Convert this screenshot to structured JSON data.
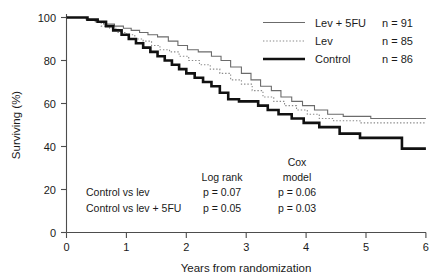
{
  "chart_data": {
    "type": "line",
    "title": "",
    "xlabel": "Years from randomization",
    "ylabel": "Surviving (%)",
    "xlim": [
      0,
      6
    ],
    "ylim": [
      0,
      100
    ],
    "xticks": [
      "0",
      "1",
      "2",
      "3",
      "4",
      "5",
      "6"
    ],
    "yticks": [
      "0",
      "20",
      "40",
      "60",
      "80",
      "100"
    ],
    "grid": false,
    "legend_position": "top-right",
    "series": [
      {
        "name": "Lev + 5FU",
        "n_label": "n = 91",
        "style": "thin-solid",
        "color": "#6b6b6b",
        "points": [
          [
            0.0,
            100
          ],
          [
            0.33,
            100
          ],
          [
            0.33,
            99
          ],
          [
            0.48,
            99
          ],
          [
            0.48,
            98
          ],
          [
            0.62,
            98
          ],
          [
            0.62,
            97
          ],
          [
            0.8,
            97
          ],
          [
            0.8,
            96
          ],
          [
            0.95,
            96
          ],
          [
            0.95,
            95
          ],
          [
            1.08,
            95
          ],
          [
            1.08,
            94
          ],
          [
            1.22,
            94
          ],
          [
            1.22,
            93
          ],
          [
            1.36,
            93
          ],
          [
            1.36,
            92
          ],
          [
            1.52,
            92
          ],
          [
            1.52,
            91
          ],
          [
            1.7,
            91
          ],
          [
            1.7,
            89
          ],
          [
            1.86,
            89
          ],
          [
            1.86,
            87
          ],
          [
            2.02,
            87
          ],
          [
            2.02,
            85
          ],
          [
            2.2,
            85
          ],
          [
            2.2,
            84
          ],
          [
            2.42,
            84
          ],
          [
            2.42,
            82
          ],
          [
            2.58,
            82
          ],
          [
            2.58,
            80
          ],
          [
            2.74,
            80
          ],
          [
            2.74,
            77
          ],
          [
            2.92,
            77
          ],
          [
            2.92,
            74
          ],
          [
            3.08,
            74
          ],
          [
            3.08,
            71
          ],
          [
            3.24,
            71
          ],
          [
            3.24,
            68
          ],
          [
            3.42,
            68
          ],
          [
            3.42,
            66
          ],
          [
            3.58,
            66
          ],
          [
            3.58,
            63
          ],
          [
            3.76,
            63
          ],
          [
            3.76,
            61
          ],
          [
            3.94,
            61
          ],
          [
            3.94,
            59
          ],
          [
            4.14,
            59
          ],
          [
            4.14,
            57
          ],
          [
            4.36,
            57
          ],
          [
            4.36,
            55
          ],
          [
            4.62,
            55
          ],
          [
            4.62,
            54
          ],
          [
            5.08,
            54
          ],
          [
            5.08,
            53
          ],
          [
            6.0,
            53
          ]
        ]
      },
      {
        "name": "Lev",
        "n_label": "n = 85",
        "style": "dotted",
        "color": "#8a8a8a",
        "points": [
          [
            0.0,
            100
          ],
          [
            0.33,
            100
          ],
          [
            0.33,
            99
          ],
          [
            0.46,
            99
          ],
          [
            0.46,
            98
          ],
          [
            0.58,
            98
          ],
          [
            0.58,
            96
          ],
          [
            0.72,
            96
          ],
          [
            0.72,
            95
          ],
          [
            0.86,
            95
          ],
          [
            0.86,
            93
          ],
          [
            1.0,
            93
          ],
          [
            1.0,
            92
          ],
          [
            1.14,
            92
          ],
          [
            1.14,
            90
          ],
          [
            1.28,
            90
          ],
          [
            1.28,
            89
          ],
          [
            1.42,
            89
          ],
          [
            1.42,
            87
          ],
          [
            1.56,
            87
          ],
          [
            1.56,
            85
          ],
          [
            1.72,
            85
          ],
          [
            1.72,
            84
          ],
          [
            1.88,
            84
          ],
          [
            1.88,
            82
          ],
          [
            2.04,
            82
          ],
          [
            2.04,
            80
          ],
          [
            2.22,
            80
          ],
          [
            2.22,
            78
          ],
          [
            2.4,
            78
          ],
          [
            2.4,
            76
          ],
          [
            2.56,
            76
          ],
          [
            2.56,
            74
          ],
          [
            2.74,
            74
          ],
          [
            2.74,
            71
          ],
          [
            2.92,
            71
          ],
          [
            2.92,
            69
          ],
          [
            3.1,
            69
          ],
          [
            3.1,
            66
          ],
          [
            3.28,
            66
          ],
          [
            3.28,
            63
          ],
          [
            3.46,
            63
          ],
          [
            3.46,
            61
          ],
          [
            3.64,
            61
          ],
          [
            3.64,
            59
          ],
          [
            3.84,
            59
          ],
          [
            3.84,
            57
          ],
          [
            4.02,
            57
          ],
          [
            4.02,
            55
          ],
          [
            4.22,
            55
          ],
          [
            4.22,
            53
          ],
          [
            4.46,
            53
          ],
          [
            4.46,
            52
          ],
          [
            4.9,
            52
          ],
          [
            4.9,
            51
          ],
          [
            6.0,
            51
          ]
        ]
      },
      {
        "name": "Control",
        "n_label": "n = 86",
        "style": "thick-solid",
        "color": "#111111",
        "points": [
          [
            0.0,
            100
          ],
          [
            0.35,
            100
          ],
          [
            0.35,
            99
          ],
          [
            0.52,
            99
          ],
          [
            0.52,
            98
          ],
          [
            0.66,
            98
          ],
          [
            0.66,
            96
          ],
          [
            0.78,
            96
          ],
          [
            0.78,
            94
          ],
          [
            0.92,
            94
          ],
          [
            0.92,
            92
          ],
          [
            1.04,
            92
          ],
          [
            1.04,
            90
          ],
          [
            1.16,
            90
          ],
          [
            1.16,
            88
          ],
          [
            1.28,
            88
          ],
          [
            1.28,
            86
          ],
          [
            1.4,
            86
          ],
          [
            1.4,
            84
          ],
          [
            1.52,
            84
          ],
          [
            1.52,
            82
          ],
          [
            1.64,
            82
          ],
          [
            1.64,
            80
          ],
          [
            1.76,
            80
          ],
          [
            1.76,
            78
          ],
          [
            1.88,
            78
          ],
          [
            1.88,
            76
          ],
          [
            2.0,
            76
          ],
          [
            2.0,
            74
          ],
          [
            2.14,
            74
          ],
          [
            2.14,
            72
          ],
          [
            2.28,
            72
          ],
          [
            2.28,
            70
          ],
          [
            2.42,
            70
          ],
          [
            2.42,
            68
          ],
          [
            2.56,
            68
          ],
          [
            2.56,
            65
          ],
          [
            2.7,
            65
          ],
          [
            2.7,
            62
          ],
          [
            2.88,
            62
          ],
          [
            2.88,
            61
          ],
          [
            3.2,
            61
          ],
          [
            3.2,
            59
          ],
          [
            3.36,
            59
          ],
          [
            3.36,
            57
          ],
          [
            3.54,
            57
          ],
          [
            3.54,
            55
          ],
          [
            3.76,
            55
          ],
          [
            3.76,
            53
          ],
          [
            3.96,
            53
          ],
          [
            3.96,
            51
          ],
          [
            4.22,
            51
          ],
          [
            4.22,
            49
          ],
          [
            4.56,
            49
          ],
          [
            4.56,
            46
          ],
          [
            4.9,
            46
          ],
          [
            4.9,
            44
          ],
          [
            5.6,
            44
          ],
          [
            5.6,
            39
          ],
          [
            6.0,
            39
          ]
        ]
      }
    ],
    "annotations": {
      "column_headers": [
        "",
        "Log rank",
        "Cox model"
      ],
      "cox_header_line1": "Cox",
      "cox_header_line2": "model",
      "logrank_header": "Log rank",
      "rows": [
        {
          "comparison": "Control vs lev",
          "log_rank": "p = 0.07",
          "cox": "p = 0.06"
        },
        {
          "comparison": "Control vs lev + 5FU",
          "log_rank": "p = 0.05",
          "cox": "p = 0.03"
        }
      ]
    }
  }
}
